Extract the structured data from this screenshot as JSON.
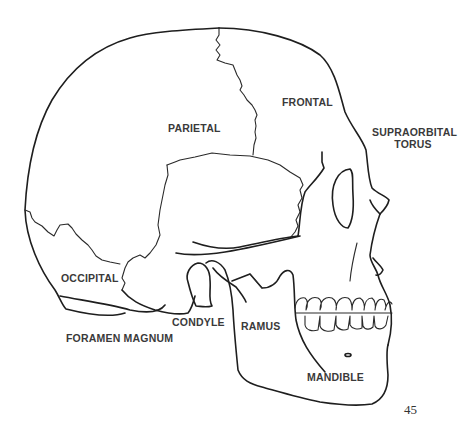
{
  "figure": {
    "labels": {
      "frontal": "FRONTAL",
      "parietal": "PARIETAL",
      "supraorbital_line1": "SUPRAORBITAL",
      "supraorbital_line2": "TORUS",
      "occipital": "OCCIPITAL",
      "condyle": "CONDYLE",
      "ramus": "RAMUS",
      "foramen_magnum": "FORAMEN MAGNUM",
      "mandible": "MANDIBLE"
    },
    "line_color": "#1e1e1e",
    "label_color": "#3a3a3a"
  },
  "page": {
    "number": "45"
  }
}
